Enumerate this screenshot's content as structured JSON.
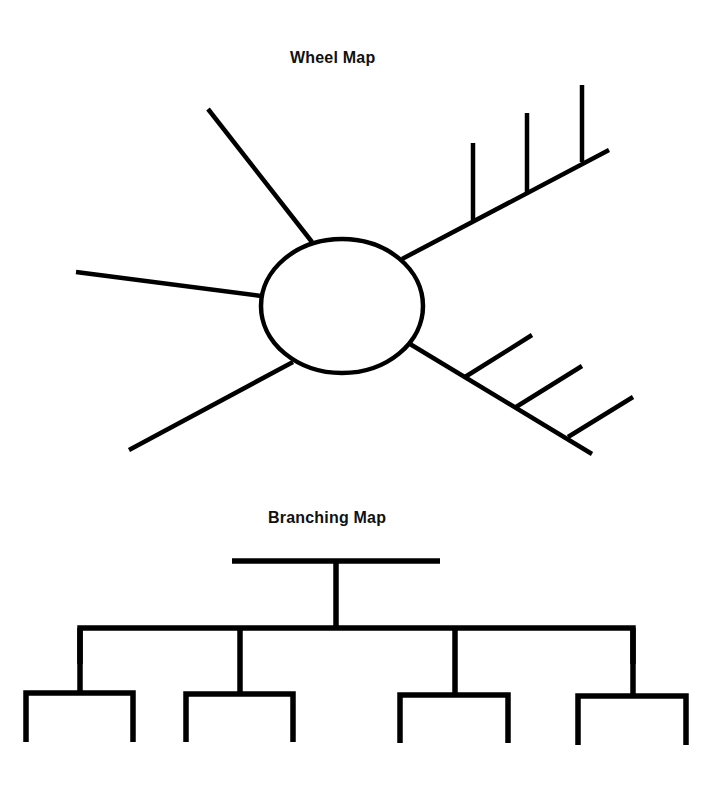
{
  "wheel_map": {
    "title": "Wheel Map",
    "hub": {
      "cx": 342,
      "cy": 306,
      "rx": 81,
      "ry": 67
    },
    "spokes": [
      {
        "name": "spoke-top",
        "x1": 312,
        "y1": 242,
        "x2": 208,
        "y2": 109
      },
      {
        "name": "spoke-left",
        "x1": 261,
        "y1": 296,
        "x2": 76,
        "y2": 272
      },
      {
        "name": "spoke-lower-left",
        "x1": 293,
        "y1": 362,
        "x2": 129,
        "y2": 450
      },
      {
        "name": "spoke-upper-right",
        "x1": 402,
        "y1": 259,
        "x2": 609,
        "y2": 150
      },
      {
        "name": "spoke-lower-right",
        "x1": 410,
        "y1": 344,
        "x2": 592,
        "y2": 454
      }
    ],
    "upper_right_tines": [
      {
        "x1": 473,
        "y1": 220,
        "x2": 473,
        "y2": 143
      },
      {
        "x1": 527,
        "y1": 192,
        "x2": 527,
        "y2": 113
      },
      {
        "x1": 582,
        "y1": 162,
        "x2": 582,
        "y2": 85
      }
    ],
    "lower_right_tines": [
      {
        "x1": 465,
        "y1": 377,
        "x2": 532,
        "y2": 335
      },
      {
        "x1": 516,
        "y1": 407,
        "x2": 582,
        "y2": 366
      },
      {
        "x1": 568,
        "y1": 437,
        "x2": 633,
        "y2": 397
      }
    ]
  },
  "branching_map": {
    "title": "Branching Map",
    "top_bar": {
      "x1": 232,
      "x2": 440,
      "y": 561
    },
    "stem": {
      "x": 336,
      "y1": 561,
      "y2": 628
    },
    "mid_bar": {
      "x1": 80,
      "x2": 633,
      "y": 628
    },
    "children": [
      {
        "stem_x": 80,
        "bracket_x1": 26,
        "bracket_x2": 133,
        "bracket_y": 693,
        "leg_bottom": 742
      },
      {
        "stem_x": 240,
        "bracket_x1": 186,
        "bracket_x2": 293,
        "bracket_y": 694,
        "leg_bottom": 742
      },
      {
        "stem_x": 455,
        "bracket_x1": 400,
        "bracket_x2": 508,
        "bracket_y": 695,
        "leg_bottom": 743
      },
      {
        "stem_x": 633,
        "bracket_x1": 578,
        "bracket_x2": 686,
        "bracket_y": 696,
        "leg_bottom": 745
      }
    ]
  },
  "colors": {
    "line": "#000000",
    "background": "#ffffff",
    "title": "#111111"
  }
}
